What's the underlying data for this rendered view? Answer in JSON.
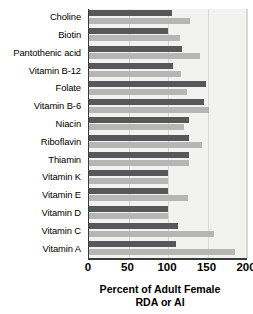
{
  "chart_data": {
    "type": "bar",
    "orientation": "horizontal",
    "title": "",
    "xlabel": "Percent of Adult Female RDA or AI",
    "xlabel_lines": [
      "Percent of Adult Female",
      "RDA or AI"
    ],
    "ylabel": "",
    "xlim": [
      0,
      200
    ],
    "xticks": [
      0,
      50,
      100,
      150,
      200
    ],
    "ticklabels": [
      "0",
      "50",
      "100",
      "150",
      "200"
    ],
    "grid": true,
    "legend": "none",
    "categories": [
      "Choline",
      "Biotin",
      "Pantothenic acid",
      "Vitamin B-12",
      "Folate",
      "Vitamin B-6",
      "Niacin",
      "Riboflavin",
      "Thiamin",
      "Vitamin K",
      "Vitamin E",
      "Vitamin D",
      "Vitamin C",
      "Vitamin A"
    ],
    "series": [
      {
        "name": "dark",
        "color": "#58585a",
        "values": [
          105,
          100,
          118,
          106,
          148,
          145,
          127,
          127,
          126,
          100,
          100,
          100,
          113,
          110
        ]
      },
      {
        "name": "light",
        "color": "#b6b6b4",
        "values": [
          128,
          115,
          140,
          116,
          124,
          152,
          120,
          143,
          126,
          100,
          125,
          100,
          158,
          185
        ]
      }
    ],
    "colors": {
      "dark_bar": "#58585a",
      "light_bar": "#b6b6b4",
      "plot_background": "#f2f2f0",
      "axis": "#3a3a3a",
      "gridline": "#d8d8d6",
      "text": "#000000"
    }
  }
}
